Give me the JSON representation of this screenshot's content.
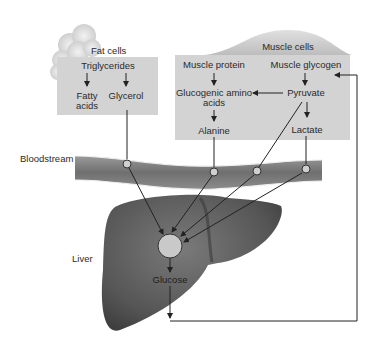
{
  "fat_cells": {
    "title": "Fat cells",
    "triglycerides": "Triglycerides",
    "fatty_acids_line1": "Fatty",
    "fatty_acids_line2": "acids",
    "glycerol": "Glycerol"
  },
  "muscle_cells": {
    "title": "Muscle cells",
    "muscle_protein": "Muscle protein",
    "muscle_glycogen": "Muscle glycogen",
    "glucogenic_line1": "Glucogenic amino",
    "glucogenic_line2": "acids",
    "pyruvate": "Pyruvate",
    "alanine": "Alanine",
    "lactate": "Lactate"
  },
  "bloodstream": {
    "label": "Bloodstream"
  },
  "liver": {
    "label": "Liver",
    "glucose": "Glucose"
  },
  "colors": {
    "box_fill": "#d3d3d3",
    "vessel": "#7d7d7d",
    "liver": "#5a5a5a",
    "line": "#333333",
    "node_fill": "#cfcfcf"
  }
}
